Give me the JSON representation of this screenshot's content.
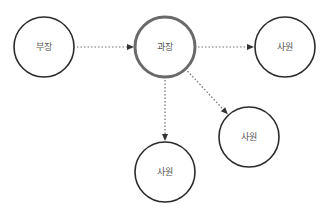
{
  "diagram": {
    "type": "organization-hierarchy",
    "nodes": [
      {
        "id": "n1",
        "label": "부장",
        "emphasized": false
      },
      {
        "id": "n2",
        "label": "과장",
        "emphasized": true
      },
      {
        "id": "n3",
        "label": "사원",
        "emphasized": false
      },
      {
        "id": "n4",
        "label": "사원",
        "emphasized": false
      },
      {
        "id": "n5",
        "label": "사원",
        "emphasized": false
      }
    ],
    "edges": [
      {
        "from": "n1",
        "to": "n2",
        "style": "dotted",
        "arrow": "end"
      },
      {
        "from": "n2",
        "to": "n3",
        "style": "dotted",
        "arrow": "end"
      },
      {
        "from": "n2",
        "to": "n4",
        "style": "dotted",
        "arrow": "end"
      },
      {
        "from": "n2",
        "to": "n5",
        "style": "dotted",
        "arrow": "end"
      }
    ]
  }
}
